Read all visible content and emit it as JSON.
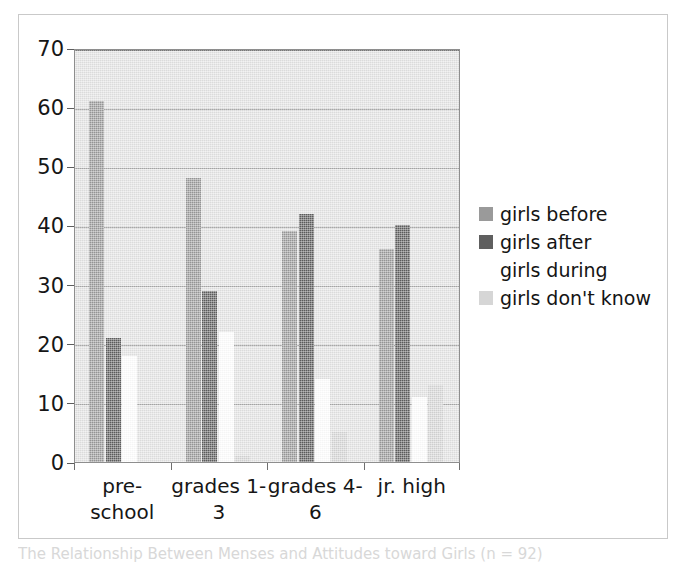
{
  "figure": {
    "caption": "The Relationship Between Menses and Attitudes toward Girls (n = 92)"
  },
  "chart_data": {
    "type": "bar",
    "title": "",
    "xlabel": "",
    "ylabel": "",
    "ylim": [
      0,
      70
    ],
    "yticks": [
      0,
      10,
      20,
      30,
      40,
      50,
      60,
      70
    ],
    "ytick_labels": [
      "0",
      "10",
      "20",
      "30",
      "40",
      "50",
      "60",
      "70"
    ],
    "grid": true,
    "legend_position": "right",
    "categories": [
      "pre-school",
      "grades 1-3",
      "grades 4-6",
      "jr. high"
    ],
    "category_lines": [
      [
        "pre-",
        "school"
      ],
      [
        "grades 1-",
        "3"
      ],
      [
        "grades 4-",
        "6"
      ],
      [
        "jr. high",
        ""
      ]
    ],
    "series": [
      {
        "name": "girls before",
        "key": "before",
        "color": "#9a9a9a",
        "values": [
          61,
          48,
          39,
          36
        ]
      },
      {
        "name": "girls after",
        "key": "after",
        "color": "#5f5f5f",
        "values": [
          21,
          29,
          42,
          40
        ]
      },
      {
        "name": "girls during",
        "key": "during",
        "color": "#ffffff",
        "values": [
          18,
          22,
          14,
          11
        ]
      },
      {
        "name": "girls don't know",
        "key": "dontknow",
        "color": "#d6d6d6",
        "values": [
          0,
          1,
          5,
          13
        ]
      }
    ]
  },
  "legend": {
    "items": [
      {
        "label": "girls before"
      },
      {
        "label": "girls after"
      },
      {
        "label": "girls during"
      },
      {
        "label": "girls don't know"
      }
    ]
  }
}
